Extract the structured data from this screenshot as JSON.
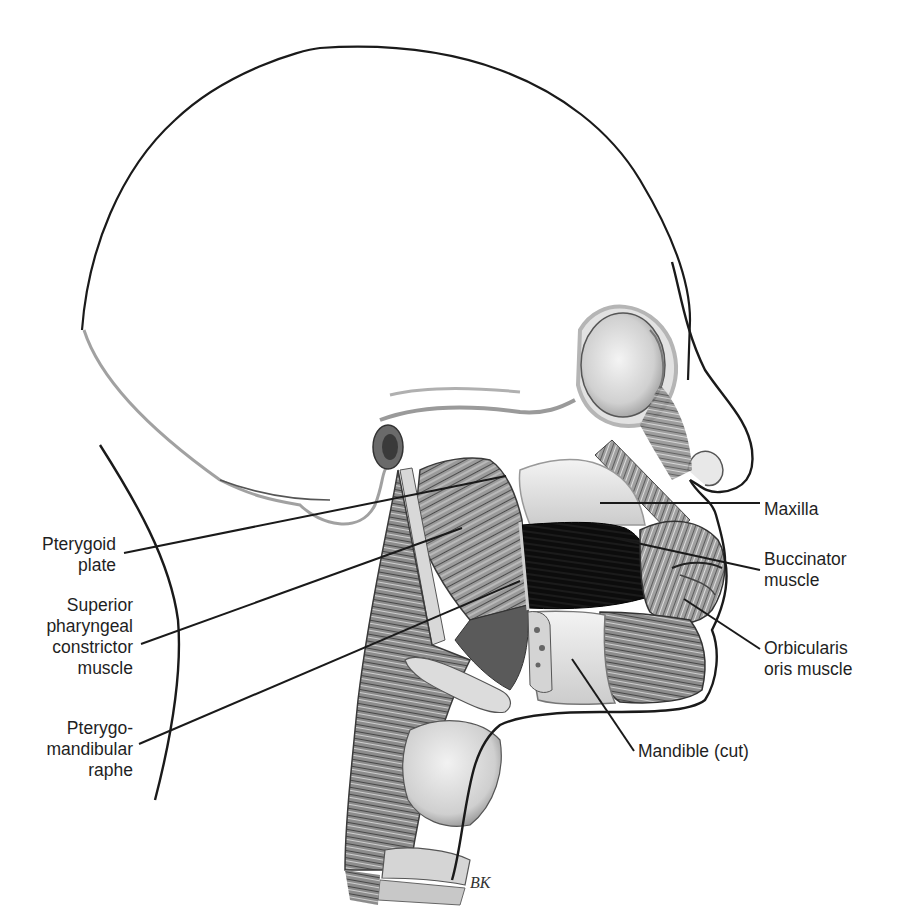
{
  "figure": {
    "type": "anatomical-illustration",
    "view": "lateral head and neck, left side facing right",
    "colors": {
      "background": "#ffffff",
      "outline": "#1a1a1a",
      "muscle_dark": "#505050",
      "muscle_mid": "#8a8a8a",
      "bone_light": "#e8e8e8",
      "buccinator_fill": "#0d0d0d",
      "label_text": "#1f1f1f"
    },
    "signature": "BK"
  },
  "labels": [
    {
      "id": "pterygoid-plate",
      "text": "Pterygoid\nplate",
      "align": "right",
      "box": {
        "left": 20,
        "top": 534,
        "width": 96
      },
      "leader": {
        "x1": 124,
        "y1": 553,
        "x2": 506,
        "y2": 476
      }
    },
    {
      "id": "superior-pharyngeal-constrictor",
      "text": "Superior\npharyngeal\nconstrictor\nmuscle",
      "align": "right",
      "box": {
        "left": 20,
        "top": 595,
        "width": 113
      },
      "leader": {
        "x1": 141,
        "y1": 644,
        "x2": 462,
        "y2": 528
      }
    },
    {
      "id": "pterygomandibular-raphe",
      "text": "Pterygo-\nmandibular\nraphe",
      "align": "right",
      "box": {
        "left": 20,
        "top": 718,
        "width": 113
      },
      "leader": {
        "x1": 139,
        "y1": 744,
        "x2": 520,
        "y2": 581
      }
    },
    {
      "id": "maxilla",
      "text": "Maxilla",
      "align": "left",
      "box": {
        "left": 764,
        "top": 499,
        "width": 120
      },
      "leader": {
        "x1": 600,
        "y1": 503,
        "x2": 760,
        "y2": 503
      }
    },
    {
      "id": "buccinator-muscle",
      "text": "Buccinator\nmuscle",
      "align": "left",
      "box": {
        "left": 764,
        "top": 549,
        "width": 120
      },
      "leader": {
        "x1": 614,
        "y1": 538,
        "x2": 760,
        "y2": 570
      }
    },
    {
      "id": "orbicularis-oris-muscle",
      "text": "Orbicularis\noris muscle",
      "align": "left",
      "box": {
        "left": 764,
        "top": 638,
        "width": 120
      },
      "leader": {
        "x1": 684,
        "y1": 599,
        "x2": 760,
        "y2": 649
      }
    },
    {
      "id": "mandible-cut",
      "text": "Mandible (cut)",
      "align": "left",
      "box": {
        "left": 638,
        "top": 741,
        "width": 160
      },
      "leader": {
        "x1": 572,
        "y1": 659,
        "x2": 634,
        "y2": 751
      }
    }
  ]
}
